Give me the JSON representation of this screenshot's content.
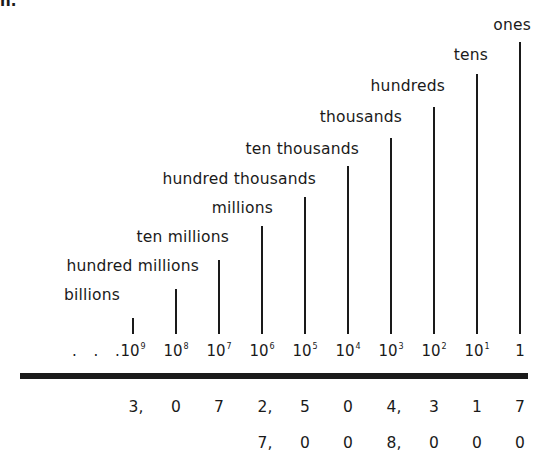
{
  "corner_fragment": "n.",
  "places": [
    {
      "name": "billions",
      "power": "10",
      "exp": "9",
      "x": 133,
      "label_right": 120,
      "label_top": 286,
      "line_top": 318
    },
    {
      "name": "hundred millions",
      "power": "10",
      "exp": "8",
      "x": 176,
      "label_right": 199,
      "label_top": 257,
      "line_top": 289
    },
    {
      "name": "ten millions",
      "power": "10",
      "exp": "7",
      "x": 219,
      "label_right": 229,
      "label_top": 228,
      "line_top": 260
    },
    {
      "name": "millions",
      "power": "10",
      "exp": "6",
      "x": 262,
      "label_right": 273,
      "label_top": 199,
      "line_top": 226
    },
    {
      "name": "hundred thousands",
      "power": "10",
      "exp": "5",
      "x": 305,
      "label_right": 316,
      "label_top": 170,
      "line_top": 197
    },
    {
      "name": "ten thousands",
      "power": "10",
      "exp": "4",
      "x": 348,
      "label_right": 359,
      "label_top": 140,
      "line_top": 166
    },
    {
      "name": "thousands",
      "power": "10",
      "exp": "3",
      "x": 391,
      "label_right": 402,
      "label_top": 108,
      "line_top": 138
    },
    {
      "name": "hundreds",
      "power": "10",
      "exp": "2",
      "x": 434,
      "label_right": 445,
      "label_top": 77,
      "line_top": 107
    },
    {
      "name": "tens",
      "power": "10",
      "exp": "1",
      "x": 477,
      "label_right": 488,
      "label_top": 46,
      "line_top": 74
    },
    {
      "name": "ones",
      "power": "1",
      "exp": "",
      "x": 520,
      "label_right": 531,
      "label_top": 16,
      "line_top": 42
    }
  ],
  "leading_dots": ". . .",
  "examples": [
    {
      "row_top": 398,
      "digits": [
        {
          "x": 133,
          "text": "3,"
        },
        {
          "x": 176,
          "text": "0"
        },
        {
          "x": 219,
          "text": "7"
        },
        {
          "x": 262,
          "text": "2,"
        },
        {
          "x": 305,
          "text": "5"
        },
        {
          "x": 348,
          "text": "0"
        },
        {
          "x": 391,
          "text": "4,"
        },
        {
          "x": 434,
          "text": "3"
        },
        {
          "x": 477,
          "text": "1"
        },
        {
          "x": 520,
          "text": "7"
        }
      ]
    },
    {
      "row_top": 434,
      "digits": [
        {
          "x": 262,
          "text": "7,"
        },
        {
          "x": 305,
          "text": "0"
        },
        {
          "x": 348,
          "text": "0"
        },
        {
          "x": 391,
          "text": "8,"
        },
        {
          "x": 434,
          "text": "0"
        },
        {
          "x": 477,
          "text": "0"
        },
        {
          "x": 520,
          "text": "0"
        }
      ]
    }
  ],
  "colors": {
    "ink": "#1a1a1a",
    "paper": "#ffffff"
  }
}
